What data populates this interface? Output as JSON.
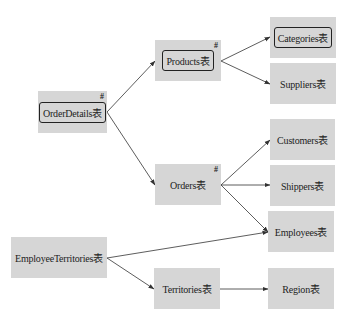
{
  "diagram": {
    "type": "table-dependency-graph",
    "nodes": [
      {
        "id": "orderdetails",
        "label": "OrderDetails表",
        "x": 38,
        "y": 91,
        "w": 69,
        "h": 42,
        "boxed": true,
        "hash": "#"
      },
      {
        "id": "products",
        "label": "Products表",
        "x": 155,
        "y": 40,
        "w": 66,
        "h": 41,
        "boxed": true,
        "hash": "#"
      },
      {
        "id": "categories",
        "label": "Categories表",
        "x": 270,
        "y": 17,
        "w": 66,
        "h": 41,
        "boxed": true,
        "hash": ""
      },
      {
        "id": "suppliers",
        "label": "Suppliers表",
        "x": 270,
        "y": 63,
        "w": 66,
        "h": 41,
        "boxed": false,
        "hash": ""
      },
      {
        "id": "customers",
        "label": "Customers表",
        "x": 270,
        "y": 119,
        "w": 65,
        "h": 41,
        "boxed": false,
        "hash": ""
      },
      {
        "id": "orders",
        "label": "Orders表",
        "x": 155,
        "y": 164,
        "w": 66,
        "h": 41,
        "boxed": false,
        "hash": "#"
      },
      {
        "id": "shippers",
        "label": "Shippers表",
        "x": 270,
        "y": 165,
        "w": 65,
        "h": 41,
        "boxed": false,
        "hash": ""
      },
      {
        "id": "employees",
        "label": "Employees表",
        "x": 268,
        "y": 211,
        "w": 66,
        "h": 41,
        "boxed": false,
        "hash": ""
      },
      {
        "id": "employeeterritories",
        "label": "EmployeeTerritories表",
        "x": 11,
        "y": 237,
        "w": 96,
        "h": 41,
        "boxed": false,
        "hash": ""
      },
      {
        "id": "territories",
        "label": "Territories表",
        "x": 154,
        "y": 268,
        "w": 66,
        "h": 41,
        "boxed": false,
        "hash": ""
      },
      {
        "id": "region",
        "label": "Region表",
        "x": 268,
        "y": 268,
        "w": 66,
        "h": 41,
        "boxed": false,
        "hash": ""
      }
    ],
    "edges": [
      {
        "from": "orderdetails",
        "to": "products",
        "x1": 107,
        "y1": 112,
        "x2": 155,
        "y2": 61
      },
      {
        "from": "orderdetails",
        "to": "orders",
        "x1": 107,
        "y1": 112,
        "x2": 155,
        "y2": 185
      },
      {
        "from": "products",
        "to": "categories",
        "x1": 221,
        "y1": 61,
        "x2": 270,
        "y2": 37
      },
      {
        "from": "products",
        "to": "suppliers",
        "x1": 221,
        "y1": 61,
        "x2": 270,
        "y2": 84
      },
      {
        "from": "orders",
        "to": "customers",
        "x1": 221,
        "y1": 185,
        "x2": 270,
        "y2": 140
      },
      {
        "from": "orders",
        "to": "shippers",
        "x1": 221,
        "y1": 185,
        "x2": 270,
        "y2": 185
      },
      {
        "from": "orders",
        "to": "employees",
        "x1": 221,
        "y1": 185,
        "x2": 268,
        "y2": 232
      },
      {
        "from": "employeeterritories",
        "to": "employees",
        "x1": 107,
        "y1": 258,
        "x2": 268,
        "y2": 232
      },
      {
        "from": "employeeterritories",
        "to": "territories",
        "x1": 107,
        "y1": 258,
        "x2": 154,
        "y2": 289
      },
      {
        "from": "territories",
        "to": "region",
        "x1": 220,
        "y1": 289,
        "x2": 268,
        "y2": 289
      }
    ],
    "colors": {
      "node_fill": "#d6d6d6",
      "edge": "#333333",
      "text": "#222222"
    }
  }
}
